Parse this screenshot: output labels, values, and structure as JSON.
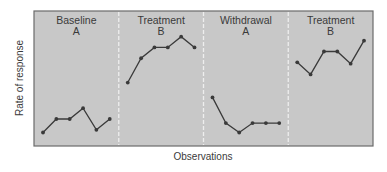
{
  "chart_data": {
    "type": "line",
    "title": "",
    "xlabel": "Observations",
    "ylabel": "Rate of response",
    "ylim": [
      0,
      100
    ],
    "grid": false,
    "legend": "none",
    "background_color": "#c8c8c8",
    "border_color": "#6b6b6b",
    "line_color": "#3a3a3a",
    "divider_color": "#eeeeee",
    "phases": [
      {
        "name": "Baseline",
        "code": "A",
        "x": [
          1,
          2,
          3,
          4,
          5,
          6
        ],
        "values": [
          10,
          20,
          20,
          28,
          12,
          20
        ]
      },
      {
        "name": "Treatment",
        "code": "B",
        "x": [
          1,
          2,
          3,
          4,
          5,
          6
        ],
        "values": [
          47,
          65,
          73,
          73,
          81,
          73
        ]
      },
      {
        "name": "Withdrawal",
        "code": "A",
        "x": [
          1,
          2,
          3,
          4,
          5,
          6
        ],
        "values": [
          36,
          17,
          10,
          17,
          17,
          17
        ]
      },
      {
        "name": "Treatment",
        "code": "B",
        "x": [
          1,
          2,
          3,
          4,
          5,
          6
        ],
        "values": [
          62,
          53,
          70,
          70,
          61,
          78
        ]
      }
    ],
    "annotations": []
  }
}
